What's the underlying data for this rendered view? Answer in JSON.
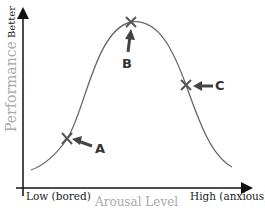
{
  "diagram": {
    "y_axis": {
      "label": "Performance",
      "top_label": "Better"
    },
    "x_axis": {
      "label": "Arousal Level",
      "low_label": "Low (bored)",
      "high_label": "High (anxious)"
    },
    "points": [
      {
        "id": "A",
        "label": "A",
        "position": "rising side, low performance"
      },
      {
        "id": "B",
        "label": "B",
        "position": "peak, best performance"
      },
      {
        "id": "C",
        "label": "C",
        "position": "falling side, moderate performance"
      }
    ],
    "colors": {
      "curve": "#666666",
      "axis": "#111111",
      "axis_label": "#aaaaaa",
      "marker": "#555555"
    }
  }
}
